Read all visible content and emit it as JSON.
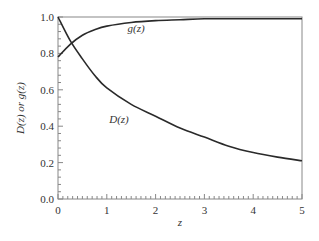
{
  "chart_data": {
    "type": "line",
    "title": "",
    "xlabel": "z",
    "ylabel": "D(z) or g(z)",
    "xlim": [
      0,
      5
    ],
    "ylim": [
      0,
      1.0
    ],
    "xticks": [
      "0",
      "1",
      "2",
      "3",
      "4",
      "5"
    ],
    "yticks": [
      "0.0",
      "0.2",
      "0.4",
      "0.6",
      "0.8",
      "1.0"
    ],
    "grid": false,
    "legend": "none (inline curve labels)",
    "annotations": [
      {
        "text": "g(z)",
        "x": 1.6,
        "y": 0.92
      },
      {
        "text": "D(z)",
        "x": 1.25,
        "y": 0.42
      }
    ],
    "series": [
      {
        "name": "D(z)",
        "x": [
          0,
          0.25,
          0.5,
          0.75,
          1,
          1.5,
          2,
          2.5,
          3,
          3.5,
          4,
          4.5,
          5
        ],
        "values": [
          1.0,
          0.87,
          0.77,
          0.68,
          0.61,
          0.52,
          0.455,
          0.39,
          0.34,
          0.29,
          0.255,
          0.23,
          0.21
        ]
      },
      {
        "name": "g(z)",
        "x": [
          0,
          0.25,
          0.5,
          0.75,
          1,
          1.5,
          2,
          2.5,
          3,
          3.5,
          4,
          4.5,
          5
        ],
        "values": [
          0.78,
          0.85,
          0.9,
          0.93,
          0.95,
          0.97,
          0.98,
          0.985,
          0.99,
          0.99,
          0.99,
          0.99,
          0.99
        ]
      }
    ]
  },
  "plot_area": {
    "left": 58,
    "right": 302,
    "top": 17,
    "bottom": 199
  },
  "colors": {
    "curve": "#2a2a2a",
    "axis": "#888888",
    "text": "#333333"
  }
}
